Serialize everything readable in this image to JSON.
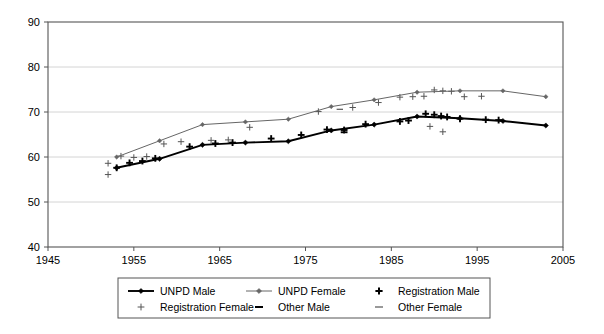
{
  "chart_data": {
    "type": "line",
    "title": "",
    "xlabel": "",
    "ylabel": "",
    "xlim": [
      1945,
      2005
    ],
    "ylim": [
      40,
      90
    ],
    "xticks": [
      1945,
      1955,
      1965,
      1975,
      1985,
      1995,
      2005
    ],
    "yticks": [
      40,
      50,
      60,
      70,
      80,
      90
    ],
    "grid": true,
    "legend_position": "bottom",
    "legend_entries": [
      {
        "label": "UNPD Male",
        "marker": "line-diamond",
        "color": "#000000"
      },
      {
        "label": "UNPD Female",
        "marker": "line-diamond",
        "color": "#666666"
      },
      {
        "label": "Registration Male",
        "marker": "plus-bold",
        "color": "#000000"
      },
      {
        "label": "Registration Female",
        "marker": "plus-thin",
        "color": "#555555"
      },
      {
        "label": "Other Male",
        "marker": "dash-bold",
        "color": "#000000"
      },
      {
        "label": "Other Female",
        "marker": "dash-thin",
        "color": "#555555"
      }
    ],
    "series": [
      {
        "name": "UNPD Male",
        "type": "line",
        "color": "#000000",
        "linewidth": 1.9,
        "marker": "diamond",
        "points": [
          [
            1953,
            57.6
          ],
          [
            1958,
            59.6
          ],
          [
            1963,
            62.7
          ],
          [
            1968,
            63.2
          ],
          [
            1973,
            63.5
          ],
          [
            1978,
            65.9
          ],
          [
            1983,
            67.2
          ],
          [
            1988,
            69.0
          ],
          [
            1993,
            68.6
          ],
          [
            1998,
            68.0
          ],
          [
            2003,
            67.0
          ]
        ]
      },
      {
        "name": "UNPD Female",
        "type": "line",
        "color": "#666666",
        "linewidth": 1.0,
        "marker": "diamond",
        "points": [
          [
            1953,
            60.0
          ],
          [
            1958,
            63.6
          ],
          [
            1963,
            67.2
          ],
          [
            1968,
            67.8
          ],
          [
            1973,
            68.4
          ],
          [
            1978,
            71.2
          ],
          [
            1983,
            72.7
          ],
          [
            1988,
            74.4
          ],
          [
            1993,
            74.7
          ],
          [
            1998,
            74.7
          ],
          [
            2003,
            73.4
          ]
        ]
      },
      {
        "name": "Registration Male",
        "type": "scatter",
        "color": "#000000",
        "marker": "plus-bold",
        "points": [
          [
            1953.0,
            57.6
          ],
          [
            1954.5,
            58.7
          ],
          [
            1956.0,
            59.1
          ],
          [
            1957.5,
            59.7
          ],
          [
            1961.5,
            62.3
          ],
          [
            1964.5,
            63.0
          ],
          [
            1966.5,
            63.2
          ],
          [
            1971.0,
            64.1
          ],
          [
            1974.5,
            64.9
          ],
          [
            1977.5,
            66.1
          ],
          [
            1979.5,
            66.0
          ],
          [
            1982.0,
            67.3
          ],
          [
            1986.0,
            67.9
          ],
          [
            1987.0,
            68.1
          ],
          [
            1989.0,
            69.6
          ],
          [
            1990.0,
            69.4
          ],
          [
            1990.8,
            69.1
          ],
          [
            1991.5,
            68.9
          ],
          [
            1993.0,
            68.5
          ],
          [
            1996.0,
            68.3
          ],
          [
            1997.5,
            68.2
          ]
        ]
      },
      {
        "name": "Registration Female",
        "type": "scatter",
        "color": "#555555",
        "marker": "plus-thin",
        "points": [
          [
            1952.0,
            58.6
          ],
          [
            1952.0,
            56.1
          ],
          [
            1953.5,
            60.2
          ],
          [
            1955.0,
            59.9
          ],
          [
            1956.5,
            60.1
          ],
          [
            1958.5,
            62.9
          ],
          [
            1960.5,
            63.4
          ],
          [
            1964.0,
            63.7
          ],
          [
            1966.0,
            63.8
          ],
          [
            1968.5,
            66.6
          ],
          [
            1976.5,
            70.1
          ],
          [
            1980.5,
            71.0
          ],
          [
            1983.5,
            72.1
          ],
          [
            1986.0,
            73.3
          ],
          [
            1987.5,
            73.4
          ],
          [
            1988.8,
            73.5
          ],
          [
            1990.0,
            74.9
          ],
          [
            1991.0,
            74.7
          ],
          [
            1992.0,
            74.6
          ],
          [
            1993.5,
            73.4
          ],
          [
            1995.5,
            73.5
          ],
          [
            1989.5,
            66.8
          ],
          [
            1991.0,
            65.6
          ]
        ]
      },
      {
        "name": "Other Male",
        "type": "scatter",
        "color": "#000000",
        "marker": "dash-bold",
        "points": [
          [
            1979.5,
            65.5
          ]
        ]
      },
      {
        "name": "Other Female",
        "type": "scatter",
        "color": "#555555",
        "marker": "dash-thin",
        "points": [
          [
            1979.0,
            70.6
          ]
        ]
      }
    ]
  }
}
